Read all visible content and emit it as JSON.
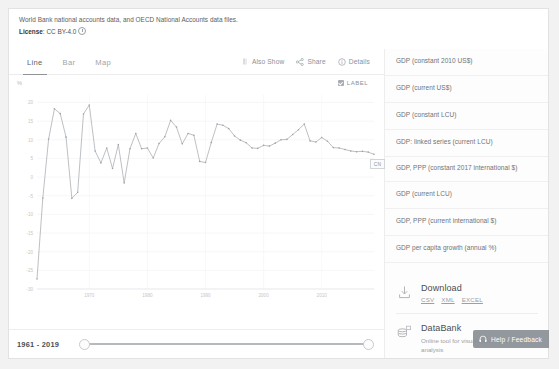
{
  "source": {
    "note": "World Bank national accounts data, and OECD National Accounts data files.",
    "license_label": "License",
    "license_sep": ":",
    "license_value": "CC BY-4.0",
    "info_icon": "info-icon"
  },
  "tabs": [
    {
      "label": "Line",
      "active": true
    },
    {
      "label": "Bar",
      "active": false
    },
    {
      "label": "Map",
      "active": false
    }
  ],
  "toolbar": {
    "also_show": "Also Show",
    "also_show_icon": "vertical-bars-icon",
    "share": "Share",
    "share_icon": "share-icon",
    "details": "Details",
    "details_icon": "info-circle-icon"
  },
  "label_toggle": {
    "text": "LABEL",
    "checked": true,
    "icon": "checkbox-checked-icon"
  },
  "chart_data": {
    "type": "line",
    "title": "",
    "xlabel": "",
    "ylabel": "",
    "unit_mark": "%",
    "series_label": "CN",
    "grid": true,
    "legend_position": "inline-end-label",
    "line_color": "#b0b5ba",
    "xlim": [
      1961,
      2019
    ],
    "ylim": [
      -30,
      22
    ],
    "yticks": [
      20,
      15,
      10,
      5,
      0,
      -5,
      -10,
      -15,
      -20,
      -25,
      -30
    ],
    "ytick_labels": [
      "20",
      "15",
      "10",
      "5",
      "0",
      "-5",
      "-10",
      "-15",
      "-20",
      "-25",
      "-30"
    ],
    "xticks": [
      1970,
      1980,
      1990,
      2000,
      2010
    ],
    "xtick_labels": [
      "1970",
      "1980",
      "1990",
      "2000",
      "2010"
    ],
    "x": [
      1961,
      1962,
      1963,
      1964,
      1965,
      1966,
      1967,
      1968,
      1969,
      1970,
      1971,
      1972,
      1973,
      1974,
      1975,
      1976,
      1977,
      1978,
      1979,
      1980,
      1981,
      1982,
      1983,
      1984,
      1985,
      1986,
      1987,
      1988,
      1989,
      1990,
      1991,
      1992,
      1993,
      1994,
      1995,
      1996,
      1997,
      1998,
      1999,
      2000,
      2001,
      2002,
      2003,
      2004,
      2005,
      2006,
      2007,
      2008,
      2009,
      2010,
      2011,
      2012,
      2013,
      2014,
      2015,
      2016,
      2017,
      2018,
      2019
    ],
    "values": [
      -27.3,
      -5.6,
      10.2,
      18.3,
      17.0,
      10.7,
      -5.7,
      -4.1,
      16.9,
      19.3,
      7.0,
      3.8,
      7.8,
      2.3,
      8.7,
      -1.6,
      7.6,
      11.7,
      7.6,
      7.8,
      5.1,
      9.0,
      10.8,
      15.2,
      13.4,
      8.9,
      11.7,
      11.2,
      4.2,
      3.9,
      9.3,
      14.2,
      13.9,
      13.0,
      11.0,
      9.9,
      9.2,
      7.8,
      7.7,
      8.5,
      8.3,
      9.1,
      10.0,
      10.1,
      11.4,
      12.7,
      14.2,
      9.7,
      9.4,
      10.6,
      9.6,
      7.9,
      7.8,
      7.4,
      7.0,
      6.8,
      6.9,
      6.7,
      6.1
    ]
  },
  "year_range": {
    "text": "1961 - 2019",
    "slider_name": "year-range-slider"
  },
  "indicators": [
    {
      "label": "GDP (constant 2010 US$)"
    },
    {
      "label": "GDP (current US$)"
    },
    {
      "label": "GDP (constant LCU)"
    },
    {
      "label": "GDP: linked series (current LCU)"
    },
    {
      "label": "GDP, PPP (constant 2017 international $)"
    },
    {
      "label": "GDP (current LCU)"
    },
    {
      "label": "GDP, PPP (current international $)"
    },
    {
      "label": "GDP per capita growth (annual %)"
    }
  ],
  "download": {
    "icon": "download-icon",
    "title": "Download",
    "formats": [
      "CSV",
      "XML",
      "EXCEL"
    ]
  },
  "databank": {
    "icon": "database-icon",
    "title": "DataBank",
    "subtitle": "Online tool for visualization and analysis"
  },
  "help": {
    "icon": "headset-icon",
    "label": "Help / Feedback"
  }
}
